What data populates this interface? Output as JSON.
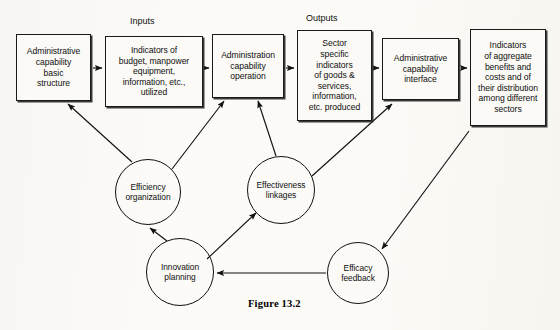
{
  "figure": {
    "caption": "Figure  13.2"
  },
  "group_labels": [
    {
      "name": "inputs-label",
      "text": "Inputs",
      "x": 130,
      "y": 16
    },
    {
      "name": "outputs-label",
      "text": "Outputs",
      "x": 306,
      "y": 13
    }
  ],
  "boxes": [
    {
      "name": "box-administrative-capability-basic-structure",
      "lines": [
        "Administrative",
        "capability",
        "basic",
        "structure"
      ],
      "x": 16,
      "y": 34,
      "w": 75,
      "h": 67
    },
    {
      "name": "box-indicators-of-budget-manpower",
      "lines": [
        "Indicators of",
        "budget, manpower",
        "equipment,",
        "information, etc.,",
        "utilized"
      ],
      "x": 105,
      "y": 36,
      "w": 98,
      "h": 71
    },
    {
      "name": "box-administration-capability-operation",
      "lines": [
        "Administration",
        "capability",
        "operation"
      ],
      "x": 212,
      "y": 34,
      "w": 72,
      "h": 64
    },
    {
      "name": "box-sector-specific-indicators",
      "lines": [
        "Sector",
        "specific",
        "indicators",
        "of goods &",
        "services,",
        "information,",
        "etc. produced"
      ],
      "x": 297,
      "y": 30,
      "w": 75,
      "h": 91
    },
    {
      "name": "box-administrative-capability-interface",
      "lines": [
        "Administrative",
        "capability",
        "interface"
      ],
      "x": 382,
      "y": 38,
      "w": 77,
      "h": 62
    },
    {
      "name": "box-indicators-of-aggregate-benefits",
      "lines": [
        "Indicators",
        "of aggregate",
        "benefits and",
        "costs and of",
        "their distribution",
        "among different",
        "sectors"
      ],
      "x": 470,
      "y": 29,
      "w": 76,
      "h": 97
    }
  ],
  "circles": [
    {
      "name": "circle-efficiency-organization",
      "lines": [
        "Efficiency",
        "organization"
      ],
      "cx": 148,
      "cy": 192,
      "r": 33
    },
    {
      "name": "circle-effectiveness-linkages",
      "lines": [
        "Effectiveness",
        "linkages"
      ],
      "cx": 281,
      "cy": 190,
      "r": 34
    },
    {
      "name": "circle-innovation-planning",
      "lines": [
        "Innovation",
        "planning"
      ],
      "cx": 180,
      "cy": 272,
      "r": 34
    },
    {
      "name": "circle-efficacy-feedback",
      "lines": [
        "Efficacy",
        "feedback"
      ],
      "cx": 358,
      "cy": 273,
      "r": 31
    }
  ],
  "edges": [
    {
      "name": "edge-basic-structure-to-inputs",
      "from": "box-administrative-capability-basic-structure",
      "to": "box-indicators-of-budget-manpower",
      "path": "M 93,68 L 102,68"
    },
    {
      "name": "edge-inputs-to-operation",
      "from": "box-indicators-of-budget-manpower",
      "to": "box-administration-capability-operation",
      "path": "M 205,68 L 209,68"
    },
    {
      "name": "edge-operation-to-outputs",
      "from": "box-administration-capability-operation",
      "to": "box-sector-specific-indicators",
      "path": "M 286,68 L 294,68"
    },
    {
      "name": "edge-outputs-to-interface",
      "from": "box-sector-specific-indicators",
      "to": "box-administrative-capability-interface",
      "path": "M 374,68 L 379,68"
    },
    {
      "name": "edge-interface-to-aggregate",
      "from": "box-administrative-capability-interface",
      "to": "box-indicators-of-aggregate-benefits",
      "path": "M 461,68 L 467,68"
    },
    {
      "name": "edge-efficiency-to-basic-structure",
      "from": "circle-efficiency-organization",
      "to": "box-administrative-capability-basic-structure",
      "path": "M 132,162 L 68,104"
    },
    {
      "name": "edge-efficiency-to-operation",
      "from": "circle-efficiency-organization",
      "to": "box-administration-capability-operation",
      "path": "M 172,169 L 224,101"
    },
    {
      "name": "edge-effectiveness-to-operation",
      "from": "circle-effectiveness-linkages",
      "to": "box-administration-capability-operation",
      "path": "M 276,156 L 258,101"
    },
    {
      "name": "edge-effectiveness-to-interface",
      "from": "circle-effectiveness-linkages",
      "to": "box-administrative-capability-interface",
      "path": "M 312,176 L 392,104"
    },
    {
      "name": "edge-innovation-to-efficiency",
      "from": "circle-innovation-planning",
      "to": "circle-efficiency-organization",
      "path": "M 167,241 L 150,228"
    },
    {
      "name": "edge-innovation-to-effectiveness",
      "from": "circle-innovation-planning",
      "to": "circle-effectiveness-linkages",
      "path": "M 207,259 L 256,213"
    },
    {
      "name": "edge-efficacy-to-innovation",
      "from": "circle-efficacy-feedback",
      "to": "circle-innovation-planning",
      "path": "M 326,273 L 217,273"
    },
    {
      "name": "edge-aggregate-to-efficacy",
      "from": "box-indicators-of-aggregate-benefits",
      "to": "circle-efficacy-feedback",
      "path": "M 469,131 L 382,249"
    }
  ],
  "colors": {
    "ink": "#111111",
    "box_fill": "#fbfaf6",
    "page": "#fcfbf8"
  }
}
